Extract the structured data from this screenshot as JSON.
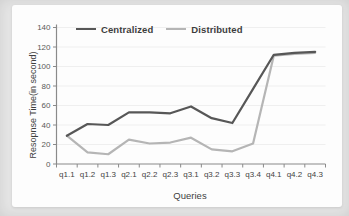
{
  "figure": {
    "surround_color": "#e6e6e6",
    "card_color": "#fdfdfd"
  },
  "chart_data": {
    "type": "line",
    "title": "",
    "xlabel": "Queries",
    "ylabel": "Resopnse Time(in second)",
    "ylim": [
      0,
      140
    ],
    "y_ticks": [
      0,
      20,
      40,
      60,
      80,
      100,
      120,
      140
    ],
    "grid": "faint horizontal gridlines",
    "legend_position": "top inside plot, horizontal",
    "categories": [
      "q1.1",
      "q1.2",
      "q1.3",
      "q2.1",
      "q2.2",
      "q2.3",
      "q3.1",
      "q3.2",
      "q3.3",
      "q3.4",
      "q4.1",
      "q4.2",
      "q4.3"
    ],
    "series": [
      {
        "name": "Centralized",
        "color": "#575757",
        "values": [
          29,
          41,
          40,
          53,
          53,
          52,
          59,
          47,
          42,
          77,
          112,
          114,
          115
        ]
      },
      {
        "name": "Distributed",
        "color": "#b5b5b5",
        "values": [
          29,
          12,
          10,
          25,
          21,
          22,
          27,
          15,
          13,
          21,
          111,
          113,
          114
        ]
      }
    ],
    "axis_color": "#8a8a8a",
    "tick_label_color": "#595959",
    "category_label_color": "#424242",
    "gridline_color": "#efefef"
  }
}
